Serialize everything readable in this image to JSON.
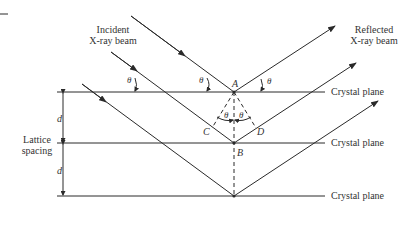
{
  "labels": {
    "incident_line1": "Incident",
    "incident_line2": "X-ray beam",
    "reflected_line1": "Reflected",
    "reflected_line2": "X-ray beam",
    "plane1": "Crystal plane",
    "plane2": "Crystal plane",
    "plane3": "Crystal plane",
    "lattice_line1": "Lattice",
    "lattice_line2": "spacing",
    "d_upper": "d",
    "d_lower": "d",
    "point_a": "A",
    "point_b": "B",
    "point_c": "C",
    "point_d": "D",
    "theta_1": "θ",
    "theta_2": "θ",
    "theta_3": "θ",
    "theta_4": "θ",
    "theta_5": "θ"
  },
  "colors": {
    "line": "#2a2a2a",
    "background": "#ffffff"
  }
}
